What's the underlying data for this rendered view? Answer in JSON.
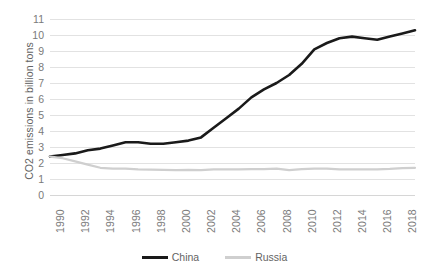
{
  "chart_data": {
    "type": "line",
    "title": "",
    "xlabel": "",
    "ylabel": "CO2 emissions in billion tons",
    "xlim": [
      1990,
      2019
    ],
    "ylim": [
      0,
      11
    ],
    "grid": true,
    "legend_position": "bottom",
    "y_ticks": [
      0,
      1,
      2,
      3,
      4,
      5,
      6,
      7,
      8,
      9,
      10,
      11
    ],
    "x_tick_labels": [
      "1990",
      "1992",
      "1994",
      "1996",
      "1998",
      "2000",
      "2002",
      "2004",
      "2006",
      "2008",
      "2010",
      "2012",
      "2014",
      "2016",
      "2018"
    ],
    "x": [
      1990,
      1991,
      1992,
      1993,
      1994,
      1995,
      1996,
      1997,
      1998,
      1999,
      2000,
      2001,
      2002,
      2003,
      2004,
      2005,
      2006,
      2007,
      2008,
      2009,
      2010,
      2011,
      2012,
      2013,
      2014,
      2015,
      2016,
      2017,
      2018,
      2019
    ],
    "series": [
      {
        "name": "China",
        "color": "#1a1a1a",
        "values": [
          2.4,
          2.5,
          2.6,
          2.8,
          2.9,
          3.1,
          3.3,
          3.3,
          3.2,
          3.2,
          3.3,
          3.4,
          3.6,
          4.2,
          4.8,
          5.4,
          6.1,
          6.6,
          7.0,
          7.5,
          8.2,
          9.1,
          9.5,
          9.8,
          9.9,
          9.8,
          9.7,
          9.9,
          10.1,
          10.3
        ]
      },
      {
        "name": "Russia",
        "color": "#cfcfcf",
        "values": [
          2.4,
          2.3,
          2.1,
          1.9,
          1.7,
          1.65,
          1.65,
          1.6,
          1.58,
          1.57,
          1.56,
          1.57,
          1.56,
          1.6,
          1.6,
          1.6,
          1.62,
          1.62,
          1.65,
          1.55,
          1.62,
          1.65,
          1.65,
          1.6,
          1.6,
          1.6,
          1.6,
          1.63,
          1.68,
          1.7
        ]
      }
    ]
  }
}
